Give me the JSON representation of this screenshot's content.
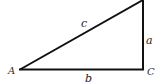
{
  "diagram": {
    "stroke_color": "#111111",
    "background": "#ffffff",
    "vertices": [
      {
        "id": "A",
        "label": "A"
      },
      {
        "id": "B",
        "label": ""
      },
      {
        "id": "C",
        "label": "C"
      }
    ],
    "sides": [
      {
        "id": "c",
        "label": "c",
        "from": "A",
        "to": "B"
      },
      {
        "id": "a",
        "label": "a",
        "from": "B",
        "to": "C"
      },
      {
        "id": "b",
        "label": "b",
        "from": "A",
        "to": "C"
      }
    ]
  }
}
